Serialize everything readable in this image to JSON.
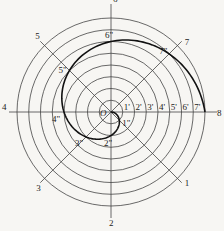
{
  "diagram": {
    "type": "archimedean-spiral-construction",
    "center": {
      "x": 111,
      "y": 112,
      "label": "O"
    },
    "circle_count": 8,
    "outer_radius": 94,
    "colors": {
      "lines": "#444444",
      "spiral": "#111111",
      "background": "#f7f6f3"
    },
    "rays": [
      {
        "label": "1",
        "angle_deg": -45
      },
      {
        "label": "2",
        "angle_deg": -90
      },
      {
        "label": "3",
        "angle_deg": -135
      },
      {
        "label": "4",
        "angle_deg": 180
      },
      {
        "label": "5",
        "angle_deg": 135
      },
      {
        "label": "6",
        "angle_deg": 90
      },
      {
        "label": "7",
        "angle_deg": 45
      },
      {
        "label": "8",
        "angle_deg": 0
      }
    ],
    "axis_divisions": [
      "1'",
      "2'",
      "3'",
      "4'",
      "5'",
      "6'",
      "7'"
    ],
    "spiral_points": [
      "1\"",
      "2\"",
      "3\"",
      "4\"",
      "5\"",
      "6\"",
      "7\"",
      "8"
    ]
  }
}
